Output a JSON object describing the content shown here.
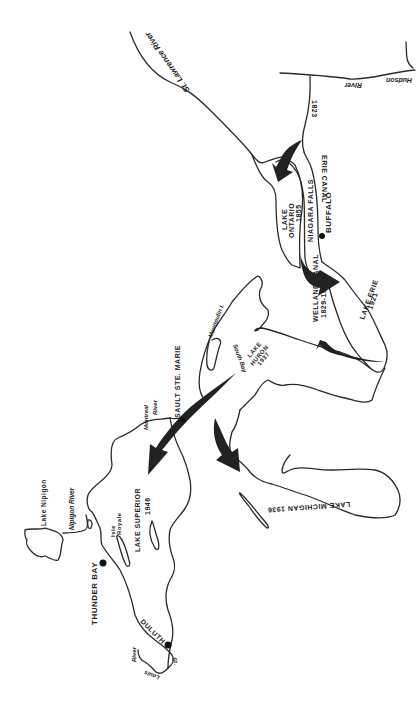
{
  "map": {
    "title": "Great Lakes - St. Lawrence navigation opening dates",
    "labels": {
      "st_lawrence_river": "St. Lawrence River",
      "hudson": "Hudson",
      "hudson_river": "River",
      "erie_canal_year": "1823",
      "erie_canal": "ERIE CANAL",
      "lake_ontario_1": "LAKE",
      "lake_ontario_2": "ONTARIO",
      "lake_ontario_year": "1855",
      "niagara_falls": "NIAGARA FALLS",
      "buffalo": "BUFFALO",
      "welland_canal": "WELLAND CANAL",
      "welland_canal_years": "1829-1933",
      "lake_erie": "LAKE ERIE",
      "lake_erie_year": "1921",
      "lake_huron_1": "LAKE",
      "lake_huron_2": "HURON",
      "lake_huron_year": "1937",
      "manitoulin": "Manitoulin I.",
      "south_bay": "South Bay",
      "sault_ste_marie": "SAULT STE. MARIE",
      "montreal": "Montreal",
      "montreal_river": "River",
      "lake_michigan": "LAKE MICHIGAN 1936",
      "lake_superior": "LAKE SUPERIOR",
      "lake_superior_year": "1946",
      "lake_nipigon": "Lake Nipigon",
      "nipigon_river": "Nipigon River",
      "isle": "Isle",
      "royale": "Royale",
      "thunder_bay": "THUNDER BAY",
      "duluth": "DULUTH",
      "st": "St.",
      "louis": "Louis",
      "louis_river": "River"
    },
    "colors": {
      "ink": "#222222",
      "background": "#ffffff"
    }
  }
}
